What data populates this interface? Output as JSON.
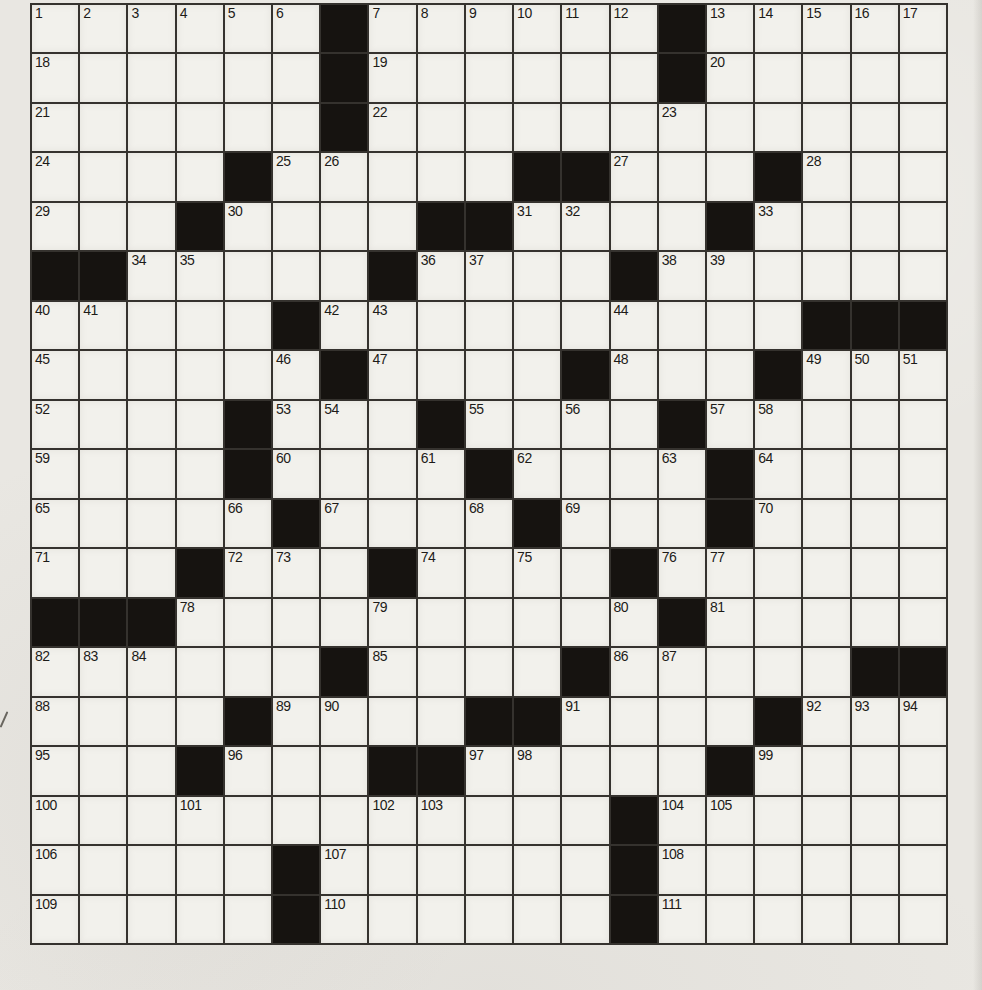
{
  "puzzle": {
    "type": "crossword",
    "rows": 19,
    "cols": 19,
    "black_cells": [
      [
        1,
        7
      ],
      [
        1,
        14
      ],
      [
        2,
        7
      ],
      [
        2,
        14
      ],
      [
        3,
        7
      ],
      [
        4,
        5
      ],
      [
        4,
        11
      ],
      [
        4,
        12
      ],
      [
        4,
        16
      ],
      [
        5,
        4
      ],
      [
        5,
        9
      ],
      [
        5,
        10
      ],
      [
        5,
        15
      ],
      [
        6,
        1
      ],
      [
        6,
        2
      ],
      [
        6,
        8
      ],
      [
        6,
        13
      ],
      [
        7,
        6
      ],
      [
        7,
        17
      ],
      [
        7,
        18
      ],
      [
        7,
        19
      ],
      [
        8,
        7
      ],
      [
        8,
        12
      ],
      [
        8,
        16
      ],
      [
        9,
        5
      ],
      [
        9,
        9
      ],
      [
        9,
        14
      ],
      [
        10,
        5
      ],
      [
        10,
        10
      ],
      [
        10,
        15
      ],
      [
        11,
        6
      ],
      [
        11,
        11
      ],
      [
        11,
        15
      ],
      [
        12,
        4
      ],
      [
        12,
        8
      ],
      [
        12,
        13
      ],
      [
        13,
        1
      ],
      [
        13,
        2
      ],
      [
        13,
        3
      ],
      [
        13,
        14
      ],
      [
        14,
        7
      ],
      [
        14,
        12
      ],
      [
        14,
        18
      ],
      [
        14,
        19
      ],
      [
        15,
        5
      ],
      [
        15,
        10
      ],
      [
        15,
        11
      ],
      [
        15,
        16
      ],
      [
        16,
        4
      ],
      [
        16,
        8
      ],
      [
        16,
        9
      ],
      [
        16,
        15
      ],
      [
        17,
        13
      ],
      [
        18,
        6
      ],
      [
        18,
        13
      ],
      [
        19,
        6
      ],
      [
        19,
        13
      ]
    ],
    "numbers": [
      {
        "n": "1",
        "r": 1,
        "c": 1
      },
      {
        "n": "2",
        "r": 1,
        "c": 2
      },
      {
        "n": "3",
        "r": 1,
        "c": 3
      },
      {
        "n": "4",
        "r": 1,
        "c": 4
      },
      {
        "n": "5",
        "r": 1,
        "c": 5
      },
      {
        "n": "6",
        "r": 1,
        "c": 6
      },
      {
        "n": "7",
        "r": 1,
        "c": 8
      },
      {
        "n": "8",
        "r": 1,
        "c": 9
      },
      {
        "n": "9",
        "r": 1,
        "c": 10
      },
      {
        "n": "10",
        "r": 1,
        "c": 11
      },
      {
        "n": "11",
        "r": 1,
        "c": 12
      },
      {
        "n": "12",
        "r": 1,
        "c": 13
      },
      {
        "n": "13",
        "r": 1,
        "c": 15
      },
      {
        "n": "14",
        "r": 1,
        "c": 16
      },
      {
        "n": "15",
        "r": 1,
        "c": 17
      },
      {
        "n": "16",
        "r": 1,
        "c": 18
      },
      {
        "n": "17",
        "r": 1,
        "c": 19
      },
      {
        "n": "18",
        "r": 2,
        "c": 1
      },
      {
        "n": "19",
        "r": 2,
        "c": 8
      },
      {
        "n": "20",
        "r": 2,
        "c": 15
      },
      {
        "n": "21",
        "r": 3,
        "c": 1
      },
      {
        "n": "22",
        "r": 3,
        "c": 8
      },
      {
        "n": "23",
        "r": 3,
        "c": 14
      },
      {
        "n": "24",
        "r": 4,
        "c": 1
      },
      {
        "n": "25",
        "r": 4,
        "c": 6
      },
      {
        "n": "26",
        "r": 4,
        "c": 7
      },
      {
        "n": "27",
        "r": 4,
        "c": 13
      },
      {
        "n": "28",
        "r": 4,
        "c": 17
      },
      {
        "n": "29",
        "r": 5,
        "c": 1
      },
      {
        "n": "30",
        "r": 5,
        "c": 5
      },
      {
        "n": "31",
        "r": 5,
        "c": 11
      },
      {
        "n": "32",
        "r": 5,
        "c": 12
      },
      {
        "n": "33",
        "r": 5,
        "c": 16
      },
      {
        "n": "34",
        "r": 6,
        "c": 3
      },
      {
        "n": "35",
        "r": 6,
        "c": 4
      },
      {
        "n": "36",
        "r": 6,
        "c": 9
      },
      {
        "n": "37",
        "r": 6,
        "c": 10
      },
      {
        "n": "38",
        "r": 6,
        "c": 14
      },
      {
        "n": "39",
        "r": 6,
        "c": 15
      },
      {
        "n": "40",
        "r": 7,
        "c": 1
      },
      {
        "n": "41",
        "r": 7,
        "c": 2
      },
      {
        "n": "42",
        "r": 7,
        "c": 7
      },
      {
        "n": "43",
        "r": 7,
        "c": 8
      },
      {
        "n": "44",
        "r": 7,
        "c": 13
      },
      {
        "n": "45",
        "r": 8,
        "c": 1
      },
      {
        "n": "46",
        "r": 8,
        "c": 6
      },
      {
        "n": "47",
        "r": 8,
        "c": 8
      },
      {
        "n": "48",
        "r": 8,
        "c": 13
      },
      {
        "n": "49",
        "r": 8,
        "c": 17
      },
      {
        "n": "50",
        "r": 8,
        "c": 18
      },
      {
        "n": "51",
        "r": 8,
        "c": 19
      },
      {
        "n": "52",
        "r": 9,
        "c": 1
      },
      {
        "n": "53",
        "r": 9,
        "c": 6
      },
      {
        "n": "54",
        "r": 9,
        "c": 7
      },
      {
        "n": "55",
        "r": 9,
        "c": 10
      },
      {
        "n": "56",
        "r": 9,
        "c": 12
      },
      {
        "n": "57",
        "r": 9,
        "c": 15
      },
      {
        "n": "58",
        "r": 9,
        "c": 16
      },
      {
        "n": "59",
        "r": 10,
        "c": 1
      },
      {
        "n": "60",
        "r": 10,
        "c": 6
      },
      {
        "n": "61",
        "r": 10,
        "c": 9
      },
      {
        "n": "62",
        "r": 10,
        "c": 11
      },
      {
        "n": "63",
        "r": 10,
        "c": 14
      },
      {
        "n": "64",
        "r": 10,
        "c": 16
      },
      {
        "n": "65",
        "r": 11,
        "c": 1
      },
      {
        "n": "66",
        "r": 11,
        "c": 5
      },
      {
        "n": "67",
        "r": 11,
        "c": 7
      },
      {
        "n": "68",
        "r": 11,
        "c": 10
      },
      {
        "n": "69",
        "r": 11,
        "c": 12
      },
      {
        "n": "70",
        "r": 11,
        "c": 16
      },
      {
        "n": "71",
        "r": 12,
        "c": 1
      },
      {
        "n": "72",
        "r": 12,
        "c": 5
      },
      {
        "n": "73",
        "r": 12,
        "c": 6
      },
      {
        "n": "74",
        "r": 12,
        "c": 9
      },
      {
        "n": "75",
        "r": 12,
        "c": 11
      },
      {
        "n": "76",
        "r": 12,
        "c": 14
      },
      {
        "n": "77",
        "r": 12,
        "c": 15
      },
      {
        "n": "78",
        "r": 13,
        "c": 4
      },
      {
        "n": "79",
        "r": 13,
        "c": 8
      },
      {
        "n": "80",
        "r": 13,
        "c": 13
      },
      {
        "n": "81",
        "r": 13,
        "c": 15
      },
      {
        "n": "82",
        "r": 14,
        "c": 1
      },
      {
        "n": "83",
        "r": 14,
        "c": 2
      },
      {
        "n": "84",
        "r": 14,
        "c": 3
      },
      {
        "n": "85",
        "r": 14,
        "c": 8
      },
      {
        "n": "86",
        "r": 14,
        "c": 13
      },
      {
        "n": "87",
        "r": 14,
        "c": 14
      },
      {
        "n": "88",
        "r": 15,
        "c": 1
      },
      {
        "n": "89",
        "r": 15,
        "c": 6
      },
      {
        "n": "90",
        "r": 15,
        "c": 7
      },
      {
        "n": "91",
        "r": 15,
        "c": 12
      },
      {
        "n": "92",
        "r": 15,
        "c": 17
      },
      {
        "n": "93",
        "r": 15,
        "c": 18
      },
      {
        "n": "94",
        "r": 15,
        "c": 19
      },
      {
        "n": "95",
        "r": 16,
        "c": 1
      },
      {
        "n": "96",
        "r": 16,
        "c": 5
      },
      {
        "n": "97",
        "r": 16,
        "c": 10
      },
      {
        "n": "98",
        "r": 16,
        "c": 11
      },
      {
        "n": "99",
        "r": 16,
        "c": 16
      },
      {
        "n": "100",
        "r": 17,
        "c": 1
      },
      {
        "n": "101",
        "r": 17,
        "c": 4
      },
      {
        "n": "102",
        "r": 17,
        "c": 8
      },
      {
        "n": "103",
        "r": 17,
        "c": 9
      },
      {
        "n": "104",
        "r": 17,
        "c": 14
      },
      {
        "n": "105",
        "r": 17,
        "c": 15
      },
      {
        "n": "106",
        "r": 18,
        "c": 1
      },
      {
        "n": "107",
        "r": 18,
        "c": 7
      },
      {
        "n": "108",
        "r": 18,
        "c": 14
      },
      {
        "n": "109",
        "r": 19,
        "c": 1
      },
      {
        "n": "110",
        "r": 19,
        "c": 7
      },
      {
        "n": "111",
        "r": 19,
        "c": 14
      }
    ],
    "cell_values": {}
  },
  "colors": {
    "paper": "#e9e7e2",
    "cell": "#f2f1ec",
    "block": "#161310",
    "line": "#35322e",
    "ink": "#1d1b18"
  }
}
